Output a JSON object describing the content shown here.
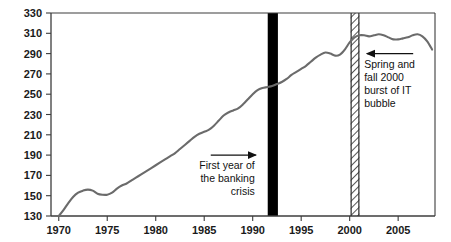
{
  "chart_data": {
    "type": "line",
    "title": "",
    "subtitle": "",
    "xlabel": "",
    "ylabel": "",
    "xlim": [
      1969.2,
      2008.8
    ],
    "ylim": [
      130,
      330
    ],
    "grid": false,
    "legend": "none",
    "legend_position": "none",
    "line_color": "#6b6b6b",
    "axis_color": "#3c3c3c",
    "y_ticks": [
      130,
      150,
      170,
      190,
      210,
      230,
      250,
      270,
      290,
      310,
      330
    ],
    "y_tick_labels": [
      "130",
      "150",
      "170",
      "190",
      "210",
      "230",
      "250",
      "270",
      "290",
      "310",
      "330"
    ],
    "x_ticks": [
      1970,
      1975,
      1980,
      1985,
      1990,
      1995,
      2000,
      2005
    ],
    "x_tick_labels": [
      "1970",
      "1975",
      "1980",
      "1985",
      "1990",
      "1995",
      "2000",
      "2005"
    ],
    "series": [
      {
        "name": "index",
        "x": [
          1970.0,
          1970.5,
          1971.0,
          1971.5,
          1972.0,
          1972.5,
          1973.0,
          1973.5,
          1974.0,
          1974.5,
          1975.0,
          1975.5,
          1976.0,
          1976.5,
          1977.0,
          1977.5,
          1978.0,
          1978.5,
          1979.0,
          1979.5,
          1980.0,
          1980.5,
          1981.0,
          1981.5,
          1982.0,
          1982.5,
          1983.0,
          1983.5,
          1984.0,
          1984.5,
          1985.0,
          1985.5,
          1986.0,
          1986.5,
          1987.0,
          1987.5,
          1988.0,
          1988.5,
          1989.0,
          1989.5,
          1990.0,
          1990.5,
          1991.0,
          1991.5,
          1992.0,
          1992.5,
          1993.0,
          1993.5,
          1994.0,
          1994.5,
          1995.0,
          1995.5,
          1996.0,
          1996.5,
          1997.0,
          1997.5,
          1998.0,
          1998.5,
          1999.0,
          1999.5,
          2000.0,
          2000.5,
          2001.0,
          2001.5,
          2002.0,
          2002.5,
          2003.0,
          2003.5,
          2004.0,
          2004.5,
          2005.0,
          2005.5,
          2006.0,
          2006.5,
          2007.0,
          2007.5,
          2008.0,
          2008.5
        ],
        "y": [
          130,
          136,
          143,
          149,
          153,
          155,
          156,
          155,
          152,
          151,
          151,
          153,
          157,
          160,
          162,
          165,
          168,
          171,
          174,
          177,
          180,
          183,
          186,
          189,
          192,
          196,
          200,
          204,
          208,
          211,
          213,
          215,
          219,
          224,
          229,
          232,
          234,
          236,
          240,
          245,
          250,
          254,
          256,
          257,
          258,
          260,
          262,
          265,
          269,
          272,
          275,
          278,
          282,
          286,
          289,
          291,
          290,
          288,
          289,
          294,
          301,
          306,
          308,
          308,
          307,
          308,
          309,
          308,
          306,
          304,
          304,
          305,
          306,
          308,
          309,
          307,
          302,
          294
        ]
      }
    ],
    "event_bands": [
      {
        "name": "banking-crisis-band",
        "style": "solid-black",
        "x_start": 1991.55,
        "x_end": 1992.6,
        "color": "#000000"
      },
      {
        "name": "it-bubble-band",
        "style": "hatched",
        "x_start": 2000.1,
        "x_end": 2001.0,
        "color": "#2b2b2b"
      }
    ],
    "annotations": [
      {
        "name": "banking-crisis-annotation",
        "lines": [
          "First year of",
          "the banking",
          "crisis"
        ],
        "align": "right",
        "arrow_direction": "right",
        "x": 1989.8,
        "y": 190
      },
      {
        "name": "it-bubble-annotation",
        "lines": [
          "Spring and",
          "fall 2000",
          "burst of IT",
          "bubble"
        ],
        "align": "left",
        "arrow_direction": "left",
        "x": 2001.6,
        "y": 290
      }
    ]
  }
}
